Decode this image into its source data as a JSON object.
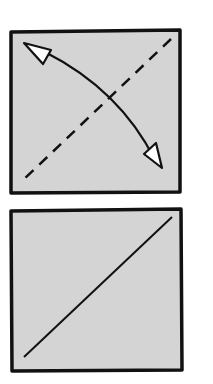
{
  "diagram": {
    "panels": [
      {
        "id": "top",
        "fill": "#d4d4d4",
        "stroke": "#111111",
        "elements": [
          "dashed-diagonal-line",
          "curved-double-arrow"
        ]
      },
      {
        "id": "bottom",
        "fill": "#d4d4d4",
        "stroke": "#111111",
        "elements": [
          "solid-diagonal-line"
        ]
      }
    ]
  }
}
